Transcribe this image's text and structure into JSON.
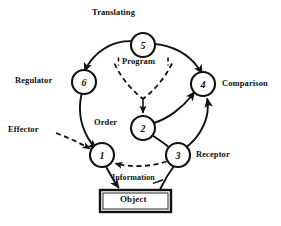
{
  "diagram": {
    "background_color": "#ffffff",
    "ink_color": "#111111",
    "nodes": [
      {
        "id": "node-5",
        "label": "5",
        "cx": 143,
        "cy": 45,
        "r": 12
      },
      {
        "id": "node-6",
        "label": "6",
        "cx": 84,
        "cy": 82,
        "r": 12
      },
      {
        "id": "node-4",
        "label": "4",
        "cx": 203,
        "cy": 84,
        "r": 12
      },
      {
        "id": "node-2",
        "label": "2",
        "cx": 143,
        "cy": 128,
        "r": 12
      },
      {
        "id": "node-1",
        "label": "1",
        "cx": 102,
        "cy": 155,
        "r": 12
      },
      {
        "id": "node-3",
        "label": "3",
        "cx": 178,
        "cy": 155,
        "r": 12
      }
    ],
    "box": {
      "id": "object-box",
      "label": "Object",
      "x": 100,
      "y": 190,
      "width": 71,
      "height": 22
    },
    "labels": {
      "translating": "Translating",
      "regulator": "Regulator",
      "comparison": "Comparison",
      "effector": "Effector",
      "order": "Order",
      "receptor": "Receptor",
      "program": "Program",
      "information": "Information",
      "object": "Object"
    },
    "edges": [
      {
        "id": "edge-5-to-6",
        "from": "node-5",
        "to": "node-6",
        "style": "solid",
        "arrow": true
      },
      {
        "id": "edge-5-to-4",
        "from": "node-5",
        "to": "node-4",
        "style": "solid",
        "arrow": true
      },
      {
        "id": "edge-6-to-1",
        "from": "node-6",
        "to": "node-1",
        "style": "solid",
        "arrow": true
      },
      {
        "id": "edge-program-to-2",
        "from": "program",
        "to": "node-2",
        "style": "dashed",
        "arrow": true
      },
      {
        "id": "edge-2-to-4",
        "from": "node-2",
        "to": "node-4",
        "style": "solid",
        "arrow": true
      },
      {
        "id": "edge-3-to-4",
        "from": "node-3",
        "to": "node-4",
        "style": "solid",
        "arrow": true
      },
      {
        "id": "edge-2-to-3",
        "from": "node-2",
        "to": "node-3",
        "style": "solid",
        "arrow": false
      },
      {
        "id": "edge-3-to-1",
        "from": "node-3",
        "to": "node-1",
        "style": "dashed",
        "arrow": true
      },
      {
        "id": "edge-effector-to-1",
        "from": "effector",
        "to": "node-1",
        "style": "dashed",
        "arrow": true
      },
      {
        "id": "edge-1-to-object",
        "from": "node-1",
        "to": "object-box",
        "style": "solid",
        "arrow": true
      },
      {
        "id": "edge-object-to-3",
        "from": "object-box",
        "to": "node-3",
        "style": "solid",
        "arrow": false
      }
    ]
  }
}
